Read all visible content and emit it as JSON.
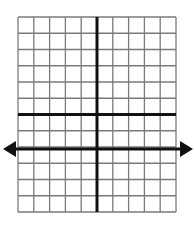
{
  "diagram": {
    "type": "coordinate-grid",
    "columns": 10,
    "rows": 12,
    "grid_left": 18,
    "grid_top": 17,
    "grid_right": 176,
    "grid_bottom": 212,
    "y_axis_column_index": 5,
    "thick_horizontal_row_index": 6,
    "arrow_axis_row_index": 8.2,
    "arrow_line_y": 149,
    "arrow_left_tip_x": 3,
    "arrow_right_tip_x": 193,
    "colors": {
      "grid_line": "#7a7a7a",
      "axis_line": "#111111",
      "background": "#ffffff"
    }
  }
}
